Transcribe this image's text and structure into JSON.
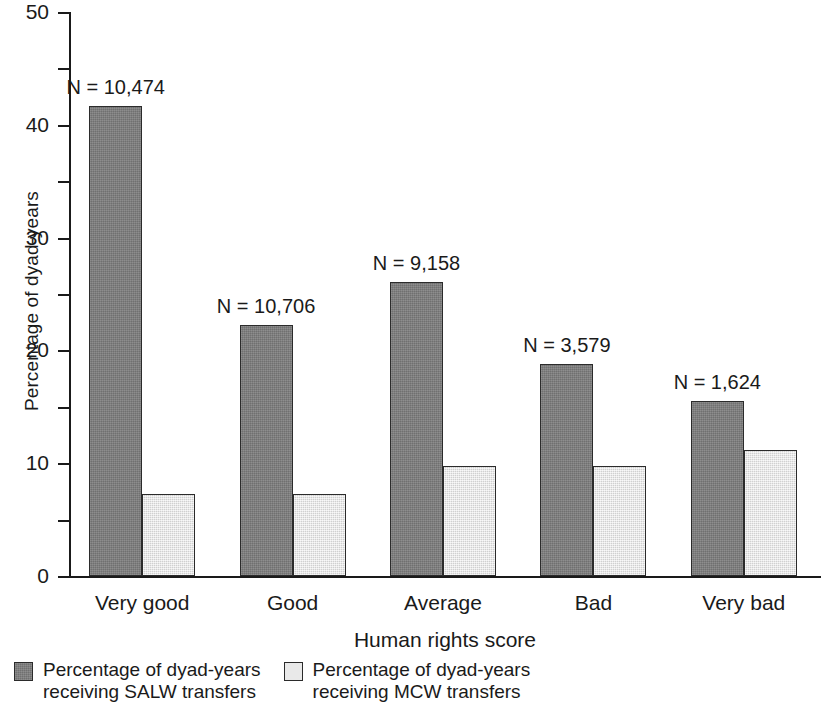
{
  "chart_data": {
    "type": "bar",
    "title": "",
    "xlabel": "Human rights score",
    "ylabel": "Percentage of dyad-years",
    "categories": [
      "Very good",
      "Good",
      "Average",
      "Bad",
      "Very bad"
    ],
    "ylim": [
      0,
      50
    ],
    "y_major_ticks": [
      0,
      10,
      20,
      30,
      40,
      50
    ],
    "y_minor_ticks": [
      5,
      15,
      25,
      35,
      45
    ],
    "y_tick_labels": [
      "0",
      "10",
      "20",
      "30",
      "40",
      "50"
    ],
    "grid": false,
    "legend_position": "below-left",
    "series": [
      {
        "name": "Percentage of dyad-years\nreceiving SALW transfers",
        "key": "salw",
        "color": "#7c7c7c",
        "values": [
          41.8,
          22.3,
          26.2,
          18.9,
          15.6
        ]
      },
      {
        "name": "Percentage of dyad-years\nreceiving MCW transfers",
        "key": "mcw",
        "color": "#e2e2e2",
        "values": [
          7.3,
          7.3,
          9.8,
          9.8,
          11.2
        ]
      }
    ],
    "annotations": [
      "N = 10,474",
      "N = 10,706",
      "N = 9,158",
      "N = 3,579",
      "N = 1,624"
    ]
  },
  "axes": {
    "y_title": "Percentage of dyad-years",
    "x_title": "Human rights score",
    "y_ticks": [
      {
        "value": 50,
        "label": "50",
        "major": true
      },
      {
        "value": 45,
        "label": "",
        "major": false
      },
      {
        "value": 40,
        "label": "40",
        "major": true
      },
      {
        "value": 35,
        "label": "",
        "major": false
      },
      {
        "value": 30,
        "label": "30",
        "major": true
      },
      {
        "value": 25,
        "label": "",
        "major": false
      },
      {
        "value": 20,
        "label": "20",
        "major": true
      },
      {
        "value": 15,
        "label": "",
        "major": false
      },
      {
        "value": 10,
        "label": "10",
        "major": true
      },
      {
        "value": 5,
        "label": "",
        "major": false
      },
      {
        "value": 0,
        "label": "0",
        "major": true
      }
    ]
  },
  "legend": {
    "items": [
      {
        "key": "salw",
        "label": "Percentage of dyad-years\nreceiving SALW transfers",
        "color": "#7c7c7c"
      },
      {
        "key": "mcw",
        "label": "Percentage of dyad-years\nreceiving MCW transfers",
        "color": "#e9e9e9"
      }
    ]
  }
}
